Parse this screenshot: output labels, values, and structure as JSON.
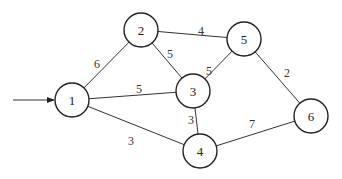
{
  "graph": {
    "type": "weighted-undirected-graph",
    "source_node": "1",
    "nodes": [
      {
        "id": "1",
        "label": "1"
      },
      {
        "id": "2",
        "label": "2"
      },
      {
        "id": "3",
        "label": "3"
      },
      {
        "id": "4",
        "label": "4"
      },
      {
        "id": "5",
        "label": "5"
      },
      {
        "id": "6",
        "label": "6"
      }
    ],
    "edges": [
      {
        "from": "1",
        "to": "2",
        "weight": "6"
      },
      {
        "from": "1",
        "to": "3",
        "weight": "5"
      },
      {
        "from": "1",
        "to": "4",
        "weight": "3"
      },
      {
        "from": "2",
        "to": "3",
        "weight": "5"
      },
      {
        "from": "2",
        "to": "5",
        "weight": "4"
      },
      {
        "from": "3",
        "to": "5",
        "weight": "5"
      },
      {
        "from": "3",
        "to": "4",
        "weight": "3"
      },
      {
        "from": "5",
        "to": "6",
        "weight": "2"
      },
      {
        "from": "4",
        "to": "6",
        "weight": "7"
      }
    ]
  }
}
